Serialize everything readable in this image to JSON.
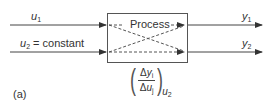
{
  "diagram": {
    "process_label": "Process",
    "inputs": [
      {
        "var": "u",
        "sub": "1",
        "suffix": ""
      },
      {
        "var": "u",
        "sub": "2",
        "suffix": " = constant"
      }
    ],
    "outputs": [
      {
        "var": "y",
        "sub": "1"
      },
      {
        "var": "y",
        "sub": "2"
      }
    ],
    "gain": {
      "numerator_delta": "Δ",
      "numerator_var": "y",
      "numerator_sub": "i",
      "denominator_delta": "Δ",
      "denominator_var": "u",
      "denominator_sub": "j",
      "held_var": "u",
      "held_sub": "2"
    },
    "panel_label": "(a)",
    "colors": {
      "line": "#444444",
      "dash": "#555555",
      "text": "#333333"
    }
  }
}
